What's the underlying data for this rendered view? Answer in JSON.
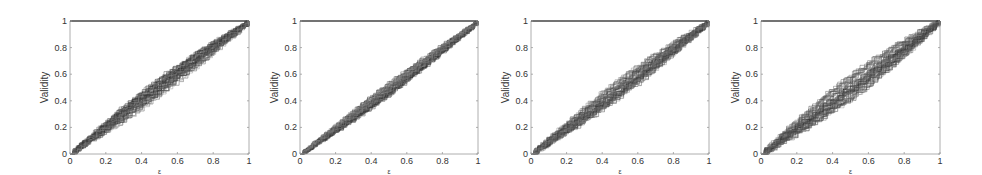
{
  "figure": {
    "width": 982,
    "height": 175,
    "line_color": "#222222",
    "axis_color": "#9a9a9a",
    "frame_top_color": "#444444"
  },
  "chart_data": [
    {
      "type": "line",
      "panel": 1,
      "title": "",
      "xlabel": "ε",
      "ylabel": "Validity",
      "xlim": [
        0,
        1
      ],
      "ylim": [
        0,
        1
      ],
      "xticks": [
        "0",
        "0.2",
        "0.4",
        "0.6",
        "0.8",
        "1"
      ],
      "yticks": [
        "0",
        "0.2",
        "0.4",
        "0.6",
        "0.8",
        "1"
      ],
      "grid": false,
      "legend": null,
      "box": {
        "left": 70,
        "right": 249,
        "top": 21,
        "bottom": 154
      },
      "series_description": "~50 empirical validity staircase curves clustered around y = x, slight concave bulge above diagonal near x 0.2-0.4, some outliers below diagonal near x 0.6-0.9",
      "n_curves": 50,
      "spread": 0.07,
      "bias": 0.02,
      "seed": 11,
      "reference_line": {
        "x": [
          0,
          1
        ],
        "y": [
          1,
          1
        ],
        "label": "y = 1"
      },
      "mean_curve": {
        "x": [
          0,
          0.2,
          0.4,
          0.6,
          0.8,
          1
        ],
        "y": [
          0,
          0.22,
          0.42,
          0.6,
          0.8,
          1
        ]
      }
    },
    {
      "type": "line",
      "panel": 2,
      "title": "",
      "xlabel": "ε",
      "ylabel": "Validity",
      "xlim": [
        0,
        1
      ],
      "ylim": [
        0,
        1
      ],
      "xticks": [
        "0",
        "0.2",
        "0.4",
        "0.6",
        "0.8",
        "1"
      ],
      "yticks": [
        "0",
        "0.2",
        "0.4",
        "0.6",
        "0.8",
        "1"
      ],
      "grid": false,
      "legend": null,
      "box": {
        "left": 300,
        "right": 478,
        "top": 21,
        "bottom": 154
      },
      "series_description": "~50 staircase curves tightly clustered along y = x, a few outliers (one above reaching 0.8 at x≈0.55, one below at ~0.6 near x≈0.9)",
      "n_curves": 50,
      "spread": 0.05,
      "bias": 0.0,
      "seed": 23,
      "reference_line": {
        "x": [
          0,
          1
        ],
        "y": [
          1,
          1
        ],
        "label": "y = 1"
      },
      "mean_curve": {
        "x": [
          0,
          0.2,
          0.4,
          0.6,
          0.8,
          1
        ],
        "y": [
          0,
          0.2,
          0.4,
          0.6,
          0.8,
          1
        ]
      }
    },
    {
      "type": "line",
      "panel": 3,
      "title": "",
      "xlabel": "ε",
      "ylabel": "Validity",
      "xlim": [
        0,
        1
      ],
      "ylim": [
        0,
        1
      ],
      "xticks": [
        "0",
        "0.2",
        "0.4",
        "0.6",
        "0.8",
        "1"
      ],
      "yticks": [
        "0",
        "0.2",
        "0.4",
        "0.6",
        "0.8",
        "1"
      ],
      "grid": false,
      "legend": null,
      "box": {
        "left": 531,
        "right": 709,
        "top": 21,
        "bottom": 154
      },
      "series_description": "~50 staircase curves along y = x with moderate spread; band approx ±0.08 at mid range",
      "n_curves": 50,
      "spread": 0.07,
      "bias": 0.0,
      "seed": 37,
      "reference_line": {
        "x": [
          0,
          1
        ],
        "y": [
          1,
          1
        ],
        "label": "y = 1"
      },
      "mean_curve": {
        "x": [
          0,
          0.2,
          0.4,
          0.6,
          0.8,
          1
        ],
        "y": [
          0,
          0.2,
          0.42,
          0.6,
          0.8,
          1
        ]
      }
    },
    {
      "type": "line",
      "panel": 4,
      "title": "",
      "xlabel": "ε",
      "ylabel": "Validity",
      "xlim": [
        0,
        1
      ],
      "ylim": [
        0,
        1
      ],
      "xticks": [
        "0",
        "0.2",
        "0.4",
        "0.6",
        "0.8",
        "1"
      ],
      "yticks": [
        "0",
        "0.2",
        "0.4",
        "0.6",
        "0.8",
        "1"
      ],
      "grid": false,
      "legend": null,
      "box": {
        "left": 761,
        "right": 940,
        "top": 21,
        "bottom": 154
      },
      "series_description": "~50 staircase curves along y = x with widest spread among the four panels (±0.1 at mid range)",
      "n_curves": 50,
      "spread": 0.09,
      "bias": 0.01,
      "seed": 51,
      "reference_line": {
        "x": [
          0,
          1
        ],
        "y": [
          1,
          1
        ],
        "label": "y = 1"
      },
      "mean_curve": {
        "x": [
          0,
          0.2,
          0.4,
          0.6,
          0.8,
          1
        ],
        "y": [
          0,
          0.2,
          0.4,
          0.6,
          0.8,
          1
        ]
      }
    }
  ]
}
